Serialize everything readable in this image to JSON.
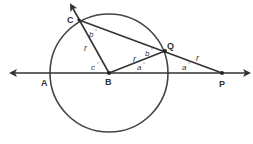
{
  "diagram": {
    "colors": {
      "stroke": "#333333",
      "background": "#ffffff"
    },
    "circle": {
      "center": "B",
      "radius_label": "r"
    },
    "points": {
      "A": "A",
      "B": "B",
      "C": "C",
      "Q": "Q",
      "P": "P"
    },
    "segment_labels": {
      "BC": "r",
      "BQ": "r",
      "QP": "r"
    },
    "angle_labels": {
      "angle_BCQ": "b",
      "angle_BQC": "b",
      "angle_CBA": "c",
      "angle_QBP": "a",
      "angle_QPB": "a"
    },
    "degree_symbol": "°"
  }
}
